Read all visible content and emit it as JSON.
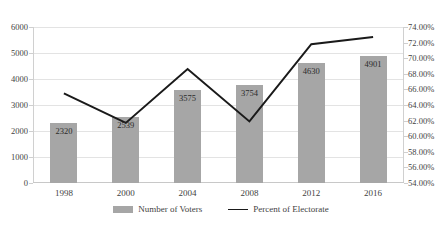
{
  "chart_data": {
    "type": "bar",
    "title": "",
    "subtitle": "",
    "xlabel": "",
    "ylabel": "",
    "categories": [
      "1998",
      "2000",
      "2004",
      "2008",
      "2012",
      "2016"
    ],
    "grid": true,
    "legend_position": "bottom",
    "axes": {
      "left": {
        "label": "",
        "ylim": [
          0,
          6000
        ],
        "ticks": [
          "0",
          "1000",
          "2000",
          "3000",
          "4000",
          "5000",
          "6000"
        ],
        "tick_values": [
          0,
          1000,
          2000,
          3000,
          4000,
          5000,
          6000
        ]
      },
      "right": {
        "label": "",
        "ylim": [
          54,
          74
        ],
        "ticks": [
          "54.00%",
          "56.00%",
          "58.00%",
          "60.00%",
          "62.00%",
          "64.00%",
          "66.00%",
          "68.00%",
          "70.00%",
          "72.00%",
          "74.00%"
        ],
        "tick_values": [
          54,
          56,
          58,
          60,
          62,
          64,
          66,
          68,
          70,
          72,
          74
        ]
      }
    },
    "series": [
      {
        "name": "Number of Voters",
        "type": "bar",
        "axis": "left",
        "color": "#a6a6a6",
        "values": [
          2320,
          2539,
          3575,
          3754,
          4630,
          4901
        ],
        "data_labels": [
          "2320",
          "2539",
          "3575",
          "3754",
          "4630",
          "4901"
        ]
      },
      {
        "name": "Percent of Electorate",
        "type": "line",
        "axis": "right",
        "color": "#1a1a1a",
        "values": [
          65.5,
          61.7,
          68.6,
          61.9,
          71.8,
          72.7
        ]
      }
    ]
  },
  "legend": {
    "items": [
      {
        "label": "Number of Voters",
        "marker": "bar-swatch"
      },
      {
        "label": "Percent of Electorate",
        "marker": "line-swatch"
      }
    ]
  }
}
